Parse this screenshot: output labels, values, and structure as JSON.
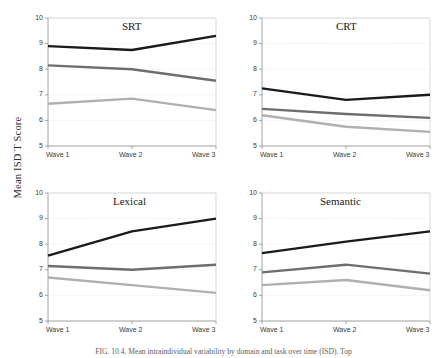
{
  "figure": {
    "ylabel": "Mean ISD T Score",
    "caption": "FIG. 10.4.   Mean intraindividual variability by domain and task over time (ISD). Top",
    "colors": {
      "series_young": "#1a1a1a",
      "series_middle": "#6e6e6e",
      "series_old": "#b0b0b0",
      "axis": "#9a9a9a",
      "grid": "#e2e2e2",
      "text": "#3a3a3a"
    }
  },
  "chart_data": [
    {
      "type": "line",
      "title": "SRT",
      "xlabel": "",
      "ylabel": "Mean ISD T Score",
      "categories": [
        "Wave 1",
        "Wave 2",
        "Wave 3"
      ],
      "yticks": [
        5,
        6,
        7,
        8,
        9,
        10
      ],
      "ylim": [
        5,
        10
      ],
      "grid": true,
      "legend": "none",
      "series": [
        {
          "name": "Series 1",
          "color": "#1a1a1a",
          "values": [
            8.9,
            8.75,
            9.3
          ]
        },
        {
          "name": "Series 2",
          "color": "#6e6e6e",
          "values": [
            8.15,
            8.0,
            7.55
          ]
        },
        {
          "name": "Series 3",
          "color": "#b0b0b0",
          "values": [
            6.65,
            6.85,
            6.4
          ]
        }
      ]
    },
    {
      "type": "line",
      "title": "CRT",
      "xlabel": "",
      "ylabel": "Mean ISD T Score",
      "categories": [
        "Wave 1",
        "Wave 2",
        "Wave 3"
      ],
      "yticks": [
        5,
        6,
        7,
        8,
        9,
        10
      ],
      "ylim": [
        5,
        10
      ],
      "grid": true,
      "legend": "none",
      "series": [
        {
          "name": "Series 1",
          "color": "#1a1a1a",
          "values": [
            7.25,
            6.8,
            7.0
          ]
        },
        {
          "name": "Series 2",
          "color": "#6e6e6e",
          "values": [
            6.45,
            6.25,
            6.1
          ]
        },
        {
          "name": "Series 3",
          "color": "#b0b0b0",
          "values": [
            6.2,
            5.75,
            5.55
          ]
        }
      ]
    },
    {
      "type": "line",
      "title": "Lexical",
      "xlabel": "",
      "ylabel": "Mean ISD T Score",
      "categories": [
        "Wave 1",
        "Wave 2",
        "Wave 3"
      ],
      "yticks": [
        5,
        6,
        7,
        8,
        9,
        10
      ],
      "ylim": [
        5,
        10
      ],
      "grid": true,
      "legend": "none",
      "series": [
        {
          "name": "Series 1",
          "color": "#1a1a1a",
          "values": [
            7.55,
            8.5,
            9.0
          ]
        },
        {
          "name": "Series 2",
          "color": "#6e6e6e",
          "values": [
            7.15,
            7.0,
            7.2
          ]
        },
        {
          "name": "Series 3",
          "color": "#b0b0b0",
          "values": [
            6.7,
            6.4,
            6.1
          ]
        }
      ]
    },
    {
      "type": "line",
      "title": "Semantic",
      "xlabel": "",
      "ylabel": "Mean ISD T Score",
      "categories": [
        "Wave 1",
        "Wave 2",
        "Wave 3"
      ],
      "yticks": [
        5,
        6,
        7,
        8,
        9,
        10
      ],
      "ylim": [
        5,
        10
      ],
      "grid": true,
      "legend": "none",
      "series": [
        {
          "name": "Series 1",
          "color": "#1a1a1a",
          "values": [
            7.65,
            8.1,
            8.5
          ]
        },
        {
          "name": "Series 2",
          "color": "#6e6e6e",
          "values": [
            6.9,
            7.2,
            6.85
          ]
        },
        {
          "name": "Series 3",
          "color": "#b0b0b0",
          "values": [
            6.4,
            6.6,
            6.2
          ]
        }
      ]
    }
  ]
}
